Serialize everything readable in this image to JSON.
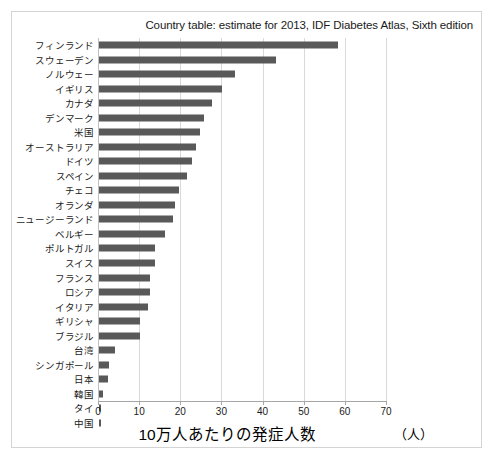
{
  "chart_data": {
    "type": "bar",
    "orientation": "horizontal",
    "title": "Country table: estimate for 2013, IDF Diabetes Atlas, Sixth edition",
    "xlabel": "10万人あたりの発症人数",
    "unit_note": "（人）",
    "ylabel": "",
    "xlim": [
      0,
      70
    ],
    "xticks": [
      0,
      10,
      20,
      30,
      40,
      50,
      60,
      70
    ],
    "xtick_labels": [
      "0",
      "10",
      "20",
      "30",
      "40",
      "50",
      "60",
      "70"
    ],
    "grid": "vertical",
    "legend": "none",
    "bar_color": "#595959",
    "categories": [
      "フィンランド",
      "スウェーデン",
      "ノルウェー",
      "イギリス",
      "カナダ",
      "デンマーク",
      "米国",
      "オーストラリア",
      "ドイツ",
      "スペイン",
      "チェコ",
      "オランダ",
      "ニュージーランド",
      "ベルギー",
      "ポルトガル",
      "スイス",
      "フランス",
      "ロシア",
      "イタリア",
      "ギリシャ",
      "ブラジル",
      "台湾",
      "シンガポール",
      "日本",
      "韓国",
      "タイ",
      "中国"
    ],
    "values": [
      58.0,
      43.0,
      33.0,
      30.0,
      27.5,
      25.5,
      24.5,
      23.5,
      22.5,
      21.5,
      19.5,
      18.5,
      18.0,
      16.0,
      13.5,
      13.5,
      12.5,
      12.5,
      12.0,
      10.0,
      10.0,
      4.0,
      2.4,
      2.2,
      0.9,
      0.6,
      0.6
    ]
  }
}
